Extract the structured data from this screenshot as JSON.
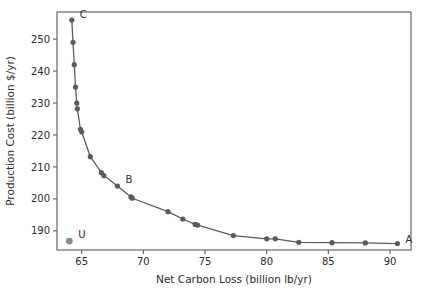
{
  "chart_data": {
    "type": "scatter",
    "title": "",
    "xlabel": "Net Carbon Loss (billion lb/yr)",
    "ylabel": "Production Cost (billion $/yr)",
    "xlim": [
      63.0,
      91.7
    ],
    "ylim": [
      184.0,
      258.5
    ],
    "xticks": [
      65,
      70,
      75,
      80,
      85,
      90
    ],
    "yticks": [
      190,
      200,
      210,
      220,
      230,
      240,
      250
    ],
    "xtick_labels": [
      "65",
      "70",
      "75",
      "80",
      "85",
      "90"
    ],
    "ytick_labels": [
      "190",
      "200",
      "210",
      "220",
      "230",
      "240",
      "250"
    ],
    "grid": false,
    "legend": "none",
    "series": [
      {
        "name": "Pareto frontier",
        "marker": "circle",
        "color": "#5a5a5a",
        "line_color": "#5a5a5a",
        "connected": true,
        "x": [
          64.2,
          64.3,
          64.4,
          64.5,
          64.6,
          64.65,
          64.9,
          65.0,
          65.7,
          66.6,
          66.8,
          67.9,
          69.0,
          69.1,
          72.0,
          73.2,
          74.2,
          74.4,
          77.3,
          80.0,
          80.7,
          82.6,
          85.3,
          88.0,
          90.6
        ],
        "y": [
          256.0,
          249.0,
          242.0,
          235.0,
          230.0,
          228.2,
          221.8,
          221.0,
          213.2,
          208.2,
          207.3,
          204.0,
          200.6,
          200.2,
          196.0,
          193.7,
          192.0,
          191.8,
          188.5,
          187.5,
          187.5,
          186.4,
          186.3,
          186.2,
          186.0
        ]
      },
      {
        "name": "Unconstrained point",
        "marker": "circle",
        "color": "#888888",
        "connected": false,
        "x": [
          64.0
        ],
        "y": [
          186.8
        ]
      }
    ],
    "annotations": [
      {
        "label": "C",
        "x": 64.2,
        "y": 256.0,
        "dx": 8,
        "dy": -2
      },
      {
        "label": "B",
        "x": 67.9,
        "y": 204.0,
        "dx": 8,
        "dy": -3
      },
      {
        "label": "A",
        "x": 90.6,
        "y": 186.0,
        "dx": 8,
        "dy": -1
      },
      {
        "label": "U",
        "x": 64.0,
        "y": 186.8,
        "dx": 9,
        "dy": -3
      }
    ]
  },
  "style": {
    "axis_color": "#5a5a5a",
    "text_color": "#2b2b2b",
    "marker_color": "#5a5a5a",
    "u_marker_color": "#888888",
    "background": "#ffffff"
  }
}
